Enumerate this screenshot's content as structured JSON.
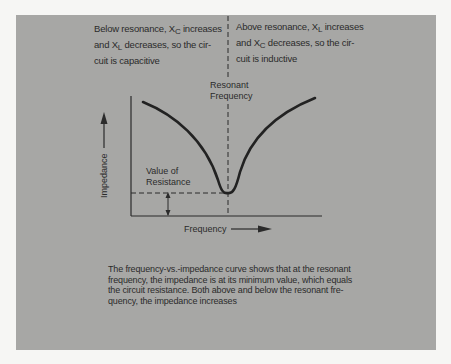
{
  "left_caption": {
    "line1_pre": "Below resonance, X",
    "line1_sub": "C",
    "line1_post": " increases",
    "line2_pre": "and X",
    "line2_sub": "L",
    "line2_post": " decreases, so the cir-",
    "line3": "cuit is capacitive"
  },
  "right_caption": {
    "line1_pre": "Above resonance, X",
    "line1_sub": "L",
    "line1_post": " increases",
    "line2_pre": "and X",
    "line2_sub": "C",
    "line2_post": " decreases, so the cir-",
    "line3": "cuit is inductive"
  },
  "graph": {
    "resonant_label_1": "Resonant",
    "resonant_label_2": "Frequency",
    "resistance_label_1": "Value of",
    "resistance_label_2": "Resistance",
    "y_axis_label": "Impedance",
    "x_axis_label": "Frequency"
  },
  "note": {
    "line1": "The frequency-vs.-impedance curve shows that at the resonant",
    "line2": "frequency, the impedance is at its minimum value, which equals",
    "line3": "the circuit resistance.  Both above and below the resonant fre-",
    "line4": "quency, the impedance increases"
  },
  "colors": {
    "panel": "#a7a7a5",
    "ink": "#2b2b2b"
  }
}
